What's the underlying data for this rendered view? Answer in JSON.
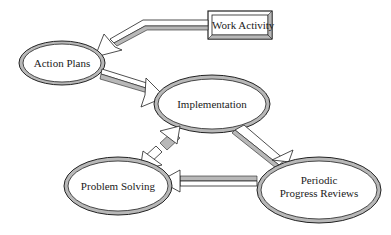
{
  "diagram": {
    "colors": {
      "ring_fill": "#b8b8b8",
      "stroke": "#222222",
      "background": "#ffffff"
    },
    "nodes": [
      {
        "id": "work-activity",
        "shape": "box",
        "label": "Work Activity"
      },
      {
        "id": "action-plans",
        "shape": "ellipse",
        "label": "Action Plans"
      },
      {
        "id": "implementation",
        "shape": "ellipse",
        "label": "Implementation"
      },
      {
        "id": "problem-solving",
        "shape": "ellipse",
        "label": "Problem Solving"
      },
      {
        "id": "periodic-progress-reviews",
        "shape": "ellipse",
        "label_line1": "Periodic",
        "label_line2": "Progress Reviews"
      }
    ],
    "edges": [
      {
        "from": "work-activity",
        "to": "action-plans"
      },
      {
        "from": "action-plans",
        "to": "implementation"
      },
      {
        "from": "implementation",
        "to": "periodic-progress-reviews"
      },
      {
        "from": "periodic-progress-reviews",
        "to": "problem-solving"
      },
      {
        "from": "implementation",
        "to": "problem-solving"
      },
      {
        "from": "problem-solving",
        "to": "implementation"
      }
    ]
  }
}
